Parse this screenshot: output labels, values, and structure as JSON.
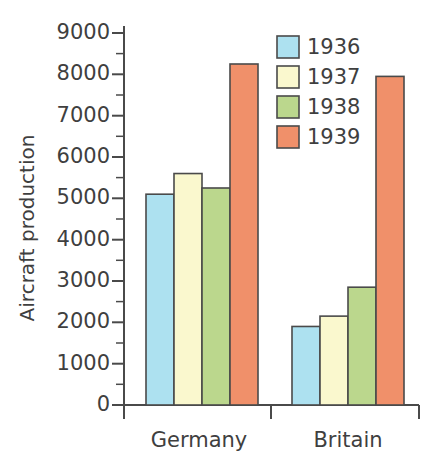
{
  "chart_data": {
    "type": "bar",
    "title": "",
    "xlabel": "",
    "ylabel": "Aircraft production",
    "categories": [
      "Germany",
      "Britain"
    ],
    "series": [
      {
        "name": "1936",
        "color": "#ADE1F0",
        "values": [
          5100,
          1900
        ]
      },
      {
        "name": "1937",
        "color": "#FAF8CE",
        "values": [
          5600,
          2150
        ]
      },
      {
        "name": "1938",
        "color": "#BBD78D",
        "values": [
          5250,
          2850
        ]
      },
      {
        "name": "1939",
        "color": "#F0906A",
        "values": [
          8250,
          7950
        ]
      }
    ],
    "ylim": [
      0,
      9000
    ],
    "ytick_step": 1000,
    "yminor_step": 500,
    "ytick_labels": [
      "0",
      "1000",
      "2000",
      "3000",
      "4000",
      "5000",
      "6000",
      "7000",
      "8000",
      "9000"
    ],
    "grid": false,
    "legend_position": "top-right",
    "legend_entries": [
      "1936",
      "1937",
      "1938",
      "1939"
    ]
  },
  "axis": {
    "y_title": "Aircraft production",
    "ticks": [
      {
        "value": 9000,
        "label": "9000"
      },
      {
        "value": 8000,
        "label": "8000"
      },
      {
        "value": 7000,
        "label": "7000"
      },
      {
        "value": 6000,
        "label": "6000"
      },
      {
        "value": 5000,
        "label": "5000"
      },
      {
        "value": 4000,
        "label": "4000"
      },
      {
        "value": 3000,
        "label": "3000"
      },
      {
        "value": 2000,
        "label": "2000"
      },
      {
        "value": 1000,
        "label": "1000"
      },
      {
        "value": 0,
        "label": "0"
      }
    ]
  },
  "categories": [
    {
      "label": "Germany"
    },
    {
      "label": "Britain"
    }
  ],
  "legend": {
    "items": [
      {
        "label": "1936",
        "color": "#ADE1F0"
      },
      {
        "label": "1937",
        "color": "#FAF8CE"
      },
      {
        "label": "1938",
        "color": "#BBD78D"
      },
      {
        "label": "1939",
        "color": "#F0906A"
      }
    ]
  },
  "colors": {
    "year_1936": "#ADE1F0",
    "year_1937": "#FAF8CE",
    "year_1938": "#BBD78D",
    "year_1939": "#F0906A",
    "axis": "#4A4A4A",
    "text": "#3F3F3F",
    "background": "#FFFFFF"
  }
}
